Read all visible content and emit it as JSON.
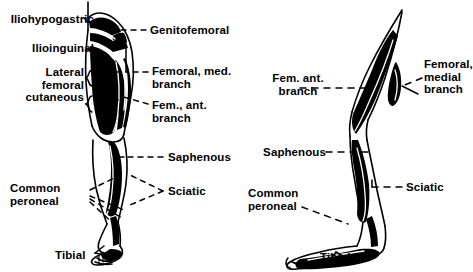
{
  "figure": {
    "background_color": "#ffffff",
    "ink_color": "#000000",
    "views": [
      {
        "name": "anterior-view",
        "position": "left"
      },
      {
        "name": "lateral-view",
        "position": "right"
      }
    ]
  },
  "left_view": {
    "labels": [
      {
        "id": "iliohypogastric",
        "text": "Iliohypogastric",
        "align": "right",
        "x": 2,
        "y": 15,
        "width": 92
      },
      {
        "id": "ilioinguinal",
        "text": "Ilioinguinal",
        "align": "right",
        "x": 2,
        "y": 44,
        "width": 92
      },
      {
        "id": "lateral-femoral-cutaneous",
        "text": "Lateral\nfemoral\ncutaneous",
        "align": "right",
        "x": 0,
        "y": 68,
        "width": 88
      },
      {
        "id": "genitofemoral",
        "text": "Genitofemoral",
        "align": "left",
        "x": 148,
        "y": 24,
        "width": 110
      },
      {
        "id": "femoral-med-branch",
        "text": "Femoral, med.\nbranch",
        "align": "left",
        "x": 150,
        "y": 65,
        "width": 90
      },
      {
        "id": "fem-ant-branch",
        "text": "Fem., ant.\nbranch",
        "align": "left",
        "x": 150,
        "y": 101,
        "width": 80
      },
      {
        "id": "saphenous",
        "text": "Saphenous",
        "align": "left",
        "x": 165,
        "y": 152,
        "width": 80
      },
      {
        "id": "sciatic",
        "text": "Sciatic",
        "align": "left",
        "x": 165,
        "y": 186,
        "width": 60
      },
      {
        "id": "common-peroneal",
        "text": "Common\nperoneal",
        "align": "left",
        "x": 10,
        "y": 183,
        "width": 76
      },
      {
        "id": "tibial",
        "text": "Tibial",
        "align": "left",
        "x": 57,
        "y": 252,
        "width": 44
      }
    ]
  },
  "right_view": {
    "labels": [
      {
        "id": "fem-ant-branch-r",
        "text": "Fem. ant.\nbranch",
        "align": "center",
        "x": 262,
        "y": 72,
        "width": 76
      },
      {
        "id": "femoral-medial-branch-r",
        "text": "Femoral,\nmedial\nbranch",
        "align": "left",
        "x": 424,
        "y": 60,
        "width": 46
      },
      {
        "id": "saphenous-r",
        "text": "Saphenous",
        "align": "right",
        "x": 249,
        "y": 147,
        "width": 78
      },
      {
        "id": "sciatic-r",
        "text": "Sciatic",
        "align": "left",
        "x": 404,
        "y": 182,
        "width": 50
      },
      {
        "id": "common-peroneal-r",
        "text": "Common\nperoneal",
        "align": "left",
        "x": 249,
        "y": 188,
        "width": 76
      },
      {
        "id": "tibial-r",
        "text": "Tibial",
        "align": "left",
        "x": 320,
        "y": 254,
        "width": 44
      }
    ]
  }
}
